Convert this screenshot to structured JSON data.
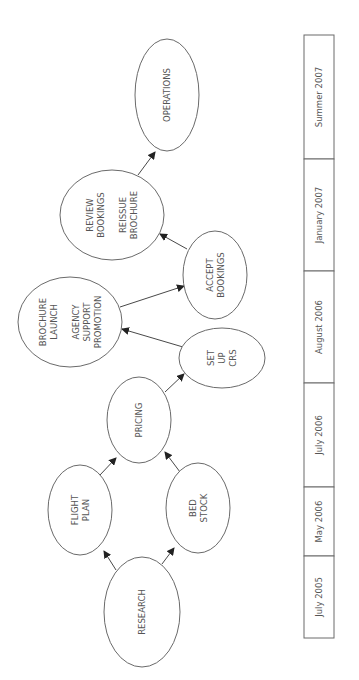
{
  "diagram": {
    "orientation": "rotated-90-ccw",
    "colors": {
      "stroke": "#6a6a6a",
      "text": "#555555",
      "arrow": "#333333",
      "background": "#ffffff"
    },
    "nodes": [
      {
        "id": "operations",
        "lines": [
          "OPERATIONS"
        ],
        "cx": 167,
        "cy": 95,
        "rx": 32,
        "ry": 56
      },
      {
        "id": "review",
        "lines": [
          "REVIEW",
          "BOOKINGS",
          "",
          "REISSUE",
          "BROCHURE"
        ],
        "cx": 112,
        "cy": 215,
        "rx": 52,
        "ry": 45
      },
      {
        "id": "brochure",
        "lines": [
          "BROCHURE",
          "LAUNCH",
          "",
          "AGENCY",
          "SUPPORT",
          "PROMOTION"
        ],
        "cx": 70,
        "cy": 322,
        "rx": 52,
        "ry": 45
      },
      {
        "id": "accept",
        "lines": [
          "ACCEPT",
          "BOOKINGS"
        ],
        "cx": 215,
        "cy": 275,
        "rx": 32,
        "ry": 44
      },
      {
        "id": "setup",
        "lines": [
          "SET",
          "UP",
          "CRS"
        ],
        "cx": 222,
        "cy": 358,
        "rx": 43,
        "ry": 30
      },
      {
        "id": "pricing",
        "lines": [
          "PRICING"
        ],
        "cx": 139,
        "cy": 420,
        "rx": 32,
        "ry": 43
      },
      {
        "id": "flight",
        "lines": [
          "FLIGHT",
          "PLAN"
        ],
        "cx": 80,
        "cy": 510,
        "rx": 32,
        "ry": 45
      },
      {
        "id": "bed",
        "lines": [
          "BED",
          "STOCK"
        ],
        "cx": 198,
        "cy": 508,
        "rx": 32,
        "ry": 45
      },
      {
        "id": "research",
        "lines": [
          "RESEARCH"
        ],
        "cx": 142,
        "cy": 612,
        "rx": 38,
        "ry": 55
      }
    ],
    "edges": [
      {
        "from": "research",
        "to": "flight",
        "x1": 116,
        "y1": 570,
        "x2": 104,
        "y2": 551
      },
      {
        "from": "research",
        "to": "bed",
        "x1": 162,
        "y1": 564,
        "x2": 174,
        "y2": 548
      },
      {
        "from": "flight",
        "to": "pricing",
        "x1": 100,
        "y1": 475,
        "x2": 116,
        "y2": 458
      },
      {
        "from": "bed",
        "to": "pricing",
        "x1": 180,
        "y1": 472,
        "x2": 165,
        "y2": 452
      },
      {
        "from": "pricing",
        "to": "setup",
        "x1": 165,
        "y1": 392,
        "x2": 184,
        "y2": 374
      },
      {
        "from": "setup",
        "to": "brochure",
        "x1": 183,
        "y1": 347,
        "x2": 122,
        "y2": 329
      },
      {
        "from": "brochure",
        "to": "accept",
        "x1": 120,
        "y1": 307,
        "x2": 184,
        "y2": 286
      },
      {
        "from": "accept",
        "to": "review",
        "x1": 187,
        "y1": 249,
        "x2": 160,
        "y2": 234
      },
      {
        "from": "review",
        "to": "operations",
        "x1": 138,
        "y1": 175,
        "x2": 155,
        "y2": 152
      }
    ],
    "timeline": {
      "x": 304,
      "width": 30,
      "periods": [
        {
          "label": "Summer 2007",
          "y1": 35,
          "y2": 159
        },
        {
          "label": "January 2007",
          "y1": 159,
          "y2": 271
        },
        {
          "label": "August 2006",
          "y1": 271,
          "y2": 383
        },
        {
          "label": "July 2006",
          "y1": 383,
          "y2": 487
        },
        {
          "label": "May 2006",
          "y1": 487,
          "y2": 556
        },
        {
          "label": "July 2005",
          "y1": 556,
          "y2": 638
        }
      ]
    }
  }
}
